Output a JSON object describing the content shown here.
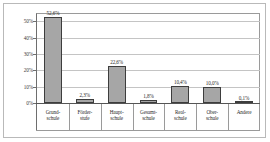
{
  "chart_data": {
    "type": "bar",
    "title": "",
    "subtitle": "",
    "xlabel": "",
    "ylabel": "",
    "categories": [
      "Grund-\nschule",
      "Förder-\nstufe",
      "Haupt-\nschule",
      "Gesamt-\nschule",
      "Real-\nschule",
      "Ober-\nschule",
      "Andere"
    ],
    "category_lines": [
      [
        "Grund-",
        "schule"
      ],
      [
        "Förder-",
        "stufe"
      ],
      [
        "Haupt-",
        "schule"
      ],
      [
        "Gesamt-",
        "schule"
      ],
      [
        "Real-",
        "schule"
      ],
      [
        "Ober-",
        "schule"
      ],
      [
        "Andere",
        ""
      ]
    ],
    "values": [
      52.6,
      2.3,
      22.6,
      1.8,
      10.4,
      10.0,
      0.1
    ],
    "value_labels": [
      "52,6%",
      "2,3%",
      "22,6%",
      "1,8%",
      "10,4%",
      "10,0%",
      "0,1%"
    ],
    "ylim": [
      0,
      55
    ],
    "yticks": [
      0,
      10,
      20,
      30,
      40,
      50
    ],
    "ytick_labels": [
      "0%",
      "10%",
      "20%",
      "30%",
      "40%",
      "50%"
    ],
    "grid": true,
    "legend": "none",
    "bar_color": "#a6a6a6",
    "bar_border_color": "#3d3d3d",
    "grid_color": "#c4c4c4",
    "axis_color": "#6e6e6e",
    "frame_color": "#b9b9b9",
    "background": "#ffffff"
  }
}
